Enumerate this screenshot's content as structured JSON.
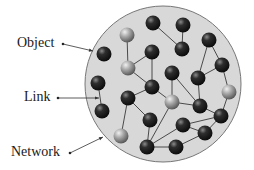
{
  "diagram": {
    "type": "network-diagram",
    "circle": {
      "cx": 163,
      "cy": 84,
      "r": 78,
      "fill": "#d8d8d8",
      "stroke": "#777777"
    },
    "labels": [
      {
        "id": "object",
        "text": "Object",
        "x": 17,
        "y": 36,
        "dot": [
          63,
          44
        ],
        "arrow_to": [
          93,
          51
        ]
      },
      {
        "id": "link",
        "text": "Link",
        "x": 24,
        "y": 90,
        "dot": [
          58,
          98
        ],
        "arrow_to": [
          99,
          98
        ]
      },
      {
        "id": "network",
        "text": "Network",
        "x": 11,
        "y": 145,
        "dot": [
          70,
          153
        ],
        "arrow_to": [
          103,
          137
        ]
      }
    ],
    "nodes": [
      {
        "x": 153,
        "y": 23,
        "shade": "dark"
      },
      {
        "x": 183,
        "y": 25,
        "shade": "dark"
      },
      {
        "x": 127,
        "y": 35,
        "shade": "light"
      },
      {
        "x": 152,
        "y": 52,
        "shade": "dark"
      },
      {
        "x": 182,
        "y": 49,
        "shade": "dark"
      },
      {
        "x": 209,
        "y": 40,
        "shade": "dark"
      },
      {
        "x": 104,
        "y": 54,
        "shade": "dark"
      },
      {
        "x": 128,
        "y": 68,
        "shade": "light"
      },
      {
        "x": 172,
        "y": 73,
        "shade": "dark"
      },
      {
        "x": 222,
        "y": 65,
        "shade": "dark"
      },
      {
        "x": 198,
        "y": 78,
        "shade": "dark"
      },
      {
        "x": 98,
        "y": 83,
        "shade": "dark"
      },
      {
        "x": 152,
        "y": 87,
        "shade": "dark"
      },
      {
        "x": 128,
        "y": 98,
        "shade": "dark"
      },
      {
        "x": 172,
        "y": 102,
        "shade": "light"
      },
      {
        "x": 229,
        "y": 92,
        "shade": "light"
      },
      {
        "x": 200,
        "y": 106,
        "shade": "dark"
      },
      {
        "x": 102,
        "y": 111,
        "shade": "dark"
      },
      {
        "x": 150,
        "y": 120,
        "shade": "dark"
      },
      {
        "x": 183,
        "y": 125,
        "shade": "dark"
      },
      {
        "x": 221,
        "y": 116,
        "shade": "dark"
      },
      {
        "x": 121,
        "y": 136,
        "shade": "light"
      },
      {
        "x": 205,
        "y": 133,
        "shade": "dark"
      },
      {
        "x": 147,
        "y": 147,
        "shade": "dark"
      },
      {
        "x": 176,
        "y": 147,
        "shade": "dark"
      }
    ],
    "links": [
      [
        0,
        4
      ],
      [
        1,
        4
      ],
      [
        2,
        7
      ],
      [
        3,
        7
      ],
      [
        3,
        12
      ],
      [
        7,
        12
      ],
      [
        5,
        9
      ],
      [
        5,
        10
      ],
      [
        9,
        10
      ],
      [
        9,
        15
      ],
      [
        10,
        16
      ],
      [
        8,
        14
      ],
      [
        8,
        16
      ],
      [
        12,
        14
      ],
      [
        12,
        13
      ],
      [
        13,
        18
      ],
      [
        13,
        21
      ],
      [
        14,
        16
      ],
      [
        14,
        23
      ],
      [
        15,
        20
      ],
      [
        16,
        20
      ],
      [
        11,
        17
      ],
      [
        19,
        20
      ],
      [
        19,
        22
      ],
      [
        19,
        23
      ],
      [
        22,
        24
      ],
      [
        20,
        22
      ],
      [
        23,
        24
      ],
      [
        18,
        23
      ]
    ]
  }
}
